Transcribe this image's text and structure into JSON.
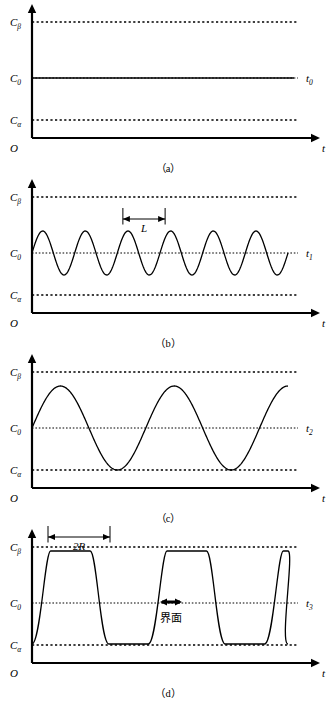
{
  "figure": {
    "axis_labels": {
      "y_beta": "C",
      "y_beta_sub": "β",
      "y_zero": "C",
      "y_zero_sub": "0",
      "y_alpha": "C",
      "y_alpha_sub": "α",
      "origin": "O",
      "x_axis": "t"
    },
    "panels": [
      {
        "caption": "（a）",
        "curve_label": "t",
        "curve_label_sub": "0",
        "type": "flat",
        "annotation": null
      },
      {
        "caption": "（b）",
        "curve_label": "t",
        "curve_label_sub": "1",
        "type": "sine-small",
        "annotation": {
          "text": "L",
          "kind": "span-arrow"
        }
      },
      {
        "caption": "（c）",
        "curve_label": "t",
        "curve_label_sub": "2",
        "type": "sine-large",
        "annotation": null
      },
      {
        "caption": "（d）",
        "curve_label": "t",
        "curve_label_sub": "3",
        "type": "square",
        "annotation": {
          "text": "2R",
          "kind": "span-arrow"
        },
        "annotation2": {
          "text": "界面",
          "kind": "interface-marker"
        }
      }
    ]
  },
  "chart_data": {
    "type": "line",
    "title": "",
    "xlabel": "t",
    "ylabel": "C",
    "ylim": [
      0,
      1
    ],
    "y_ticks": [
      {
        "label": "Cα",
        "value": 0.12
      },
      {
        "label": "C0",
        "value": 0.5
      },
      {
        "label": "Cβ",
        "value": 0.88
      }
    ],
    "grid": false,
    "legend_position": "right-inline",
    "series": [
      {
        "name": "t0",
        "panel": "a",
        "description": "constant concentration at C0",
        "amplitude": 0.0,
        "cycles": 0,
        "mean": 0.5
      },
      {
        "name": "t1",
        "panel": "b",
        "description": "small amplitude sinusoid about C0, wavelength L marked",
        "amplitude": 0.16,
        "cycles": 6,
        "mean": 0.5
      },
      {
        "name": "t2",
        "panel": "c",
        "description": "large amplitude sinusoid reaching Cα and Cβ",
        "amplitude": 0.38,
        "cycles": 2.25,
        "mean": 0.5
      },
      {
        "name": "t3",
        "panel": "d",
        "description": "square wave plateaus at Cα and Cβ, plateau width 2R, interface at C0",
        "amplitude": 0.38,
        "cycles": 2.2,
        "mean": 0.5
      }
    ]
  }
}
